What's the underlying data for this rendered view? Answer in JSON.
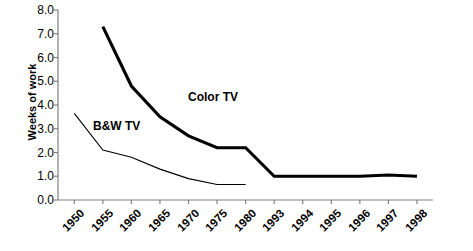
{
  "chart": {
    "ylabel": "Weeks of work",
    "y_ticks": [
      "0.0",
      "1.0",
      "2.0",
      "3.0",
      "4.0",
      "5.0",
      "6.0",
      "7.0",
      "8.0"
    ],
    "x_ticks": [
      "1950",
      "1955",
      "1960",
      "1965",
      "1970",
      "1975",
      "1980",
      "1993",
      "1994",
      "1995",
      "1996",
      "1997",
      "1998"
    ],
    "annotation_color_tv": "Color TV",
    "annotation_bw_tv": "B&W TV",
    "line_color": "#000000"
  },
  "chart_data": {
    "type": "line",
    "title": "",
    "xlabel": "",
    "ylabel": "Weeks of work",
    "ylim": [
      0.0,
      8.0
    ],
    "ytick_step": 1.0,
    "grid": false,
    "legend": "inline-annotations",
    "categories": [
      "1950",
      "1955",
      "1960",
      "1965",
      "1970",
      "1975",
      "1980",
      "1993",
      "1994",
      "1995",
      "1996",
      "1997",
      "1998"
    ],
    "series": [
      {
        "name": "Color TV",
        "values": [
          null,
          7.3,
          4.8,
          3.5,
          2.7,
          2.2,
          2.2,
          1.0,
          1.0,
          1.0,
          1.0,
          1.05,
          1.0
        ],
        "line_width": "thick"
      },
      {
        "name": "B&W TV",
        "values": [
          3.65,
          2.1,
          1.8,
          1.3,
          0.9,
          0.65,
          0.65,
          null,
          null,
          null,
          null,
          null,
          null
        ],
        "line_width": "thin"
      }
    ]
  }
}
